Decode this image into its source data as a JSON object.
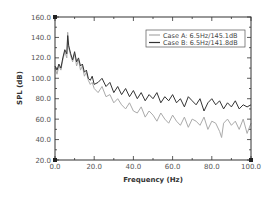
{
  "chart_data": {
    "type": "line",
    "title": "",
    "xlabel": "Frequency (Hz)",
    "ylabel": "SPL (dB)",
    "xlim": [
      0,
      100
    ],
    "ylim": [
      20,
      160
    ],
    "xticks": [
      "0.0",
      "20.0",
      "40.0",
      "60.0",
      "80.0",
      "100.0"
    ],
    "yticks": [
      "20.0",
      "40.0",
      "60.0",
      "80.0",
      "100.0",
      "120.0",
      "140.0",
      "160.0"
    ],
    "grid": false,
    "legend_position": "upper right",
    "series": [
      {
        "name": "Case A: 6.5Hz/145.1dB",
        "color": "#aaaaaa",
        "peak": {
          "x": 6.5,
          "y": 145.1
        },
        "x": [
          0,
          1,
          2,
          3,
          4,
          5,
          6,
          6.5,
          7,
          8,
          9,
          10,
          11,
          12,
          13,
          14,
          15,
          16,
          17,
          18,
          19,
          20,
          22,
          24,
          26,
          28,
          30,
          32,
          34,
          36,
          38,
          40,
          42,
          44,
          46,
          48,
          50,
          52,
          54,
          56,
          58,
          60,
          62,
          64,
          66,
          68,
          70,
          72,
          74,
          76,
          78,
          80,
          82,
          84,
          85,
          86,
          88,
          90,
          92,
          94,
          96,
          98,
          100
        ],
        "y": [
          110,
          104,
          112,
          108,
          118,
          126,
          120,
          145,
          130,
          122,
          116,
          124,
          112,
          118,
          108,
          112,
          102,
          106,
          98,
          94,
          96,
          90,
          86,
          92,
          82,
          84,
          76,
          80,
          74,
          70,
          76,
          68,
          66,
          72,
          62,
          68,
          64,
          58,
          66,
          60,
          56,
          64,
          58,
          54,
          62,
          52,
          60,
          58,
          54,
          62,
          50,
          58,
          56,
          48,
          42,
          56,
          60,
          54,
          58,
          50,
          60,
          46,
          56
        ]
      },
      {
        "name": "Case B: 6.5Hz/141.8dB",
        "color": "#333333",
        "peak": {
          "x": 6.5,
          "y": 141.8
        },
        "x": [
          0,
          1,
          2,
          3,
          4,
          5,
          6,
          6.5,
          7,
          8,
          9,
          10,
          11,
          12,
          13,
          14,
          15,
          16,
          17,
          18,
          19,
          20,
          22,
          24,
          26,
          28,
          30,
          32,
          34,
          36,
          38,
          40,
          42,
          44,
          46,
          48,
          50,
          52,
          54,
          56,
          58,
          60,
          62,
          64,
          66,
          68,
          70,
          72,
          74,
          76,
          78,
          80,
          82,
          84,
          86,
          88,
          90,
          92,
          94,
          96,
          98,
          100
        ],
        "y": [
          112,
          108,
          114,
          110,
          120,
          128,
          124,
          141.8,
          132,
          124,
          118,
          126,
          116,
          120,
          112,
          114,
          106,
          108,
          100,
          98,
          102,
          94,
          96,
          100,
          92,
          96,
          86,
          92,
          84,
          90,
          82,
          88,
          80,
          86,
          78,
          84,
          80,
          86,
          76,
          82,
          78,
          84,
          76,
          80,
          72,
          82,
          78,
          74,
          80,
          68,
          76,
          80,
          74,
          78,
          70,
          76,
          72,
          78,
          70,
          74,
          72,
          74
        ]
      }
    ]
  }
}
